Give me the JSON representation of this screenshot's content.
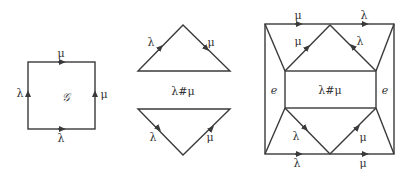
{
  "colors": {
    "stroke": "#3a3a3a",
    "text": "#333333",
    "background": "#ffffff"
  },
  "square": {
    "center_label": "𝒢",
    "top_label": "μ",
    "left_label": "λ",
    "right_label": "μ",
    "bottom_label": "λ"
  },
  "triangles": {
    "top": {
      "left_label": "λ",
      "right_label": "μ"
    },
    "middle_label": "λ#μ",
    "bottom": {
      "left_label": "λ",
      "right_label": "μ"
    }
  },
  "surface": {
    "top_left_label": "μ",
    "top_right_label": "λ",
    "upper_left_diag_label": "μ",
    "upper_right_diag_label": "λ",
    "center_label": "λ#μ",
    "left_label": "e",
    "right_label": "e",
    "lower_left_diag_label": "λ",
    "lower_right_diag_label": "μ",
    "bottom_left_label": "λ",
    "bottom_right_label": "μ"
  }
}
